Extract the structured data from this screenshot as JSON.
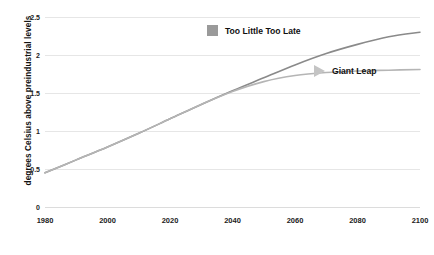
{
  "chart_data": {
    "type": "line",
    "title": "",
    "xlabel": "",
    "ylabel": "degrees Celsius above preindustrial levels",
    "xlim": [
      1980,
      2100
    ],
    "ylim": [
      0,
      2.5
    ],
    "grid": true,
    "legend_position": "inside-upper-right",
    "xticks": [
      1980,
      2000,
      2020,
      2040,
      2060,
      2080,
      2100
    ],
    "yticks": [
      0,
      0.5,
      1,
      1.5,
      2,
      2.5
    ],
    "ytick_labels": [
      "0",
      "0.5",
      "1",
      "1.5",
      "2",
      "2.5"
    ],
    "xtick_labels": [
      "1980",
      "2000",
      "2020",
      "2040",
      "2060",
      "2080",
      "2100"
    ],
    "x": [
      1980,
      1990,
      2000,
      2010,
      2020,
      2030,
      2040,
      2050,
      2060,
      2070,
      2080,
      2090,
      2100
    ],
    "series": [
      {
        "name": "Too Little Too Late",
        "marker": "square",
        "color": "#8a8a8a",
        "values": [
          0.45,
          0.62,
          0.79,
          0.97,
          1.16,
          1.35,
          1.53,
          1.7,
          1.87,
          2.02,
          2.14,
          2.24,
          2.3
        ]
      },
      {
        "name": "Giant Leap",
        "marker": "triangle",
        "color": "#b5b5b5",
        "values": [
          0.45,
          0.62,
          0.79,
          0.97,
          1.16,
          1.35,
          1.52,
          1.65,
          1.73,
          1.77,
          1.79,
          1.8,
          1.81
        ]
      }
    ]
  },
  "legend": {
    "too_little_too_late": "Too Little Too Late",
    "giant_leap": "Giant Leap"
  },
  "caption": ""
}
